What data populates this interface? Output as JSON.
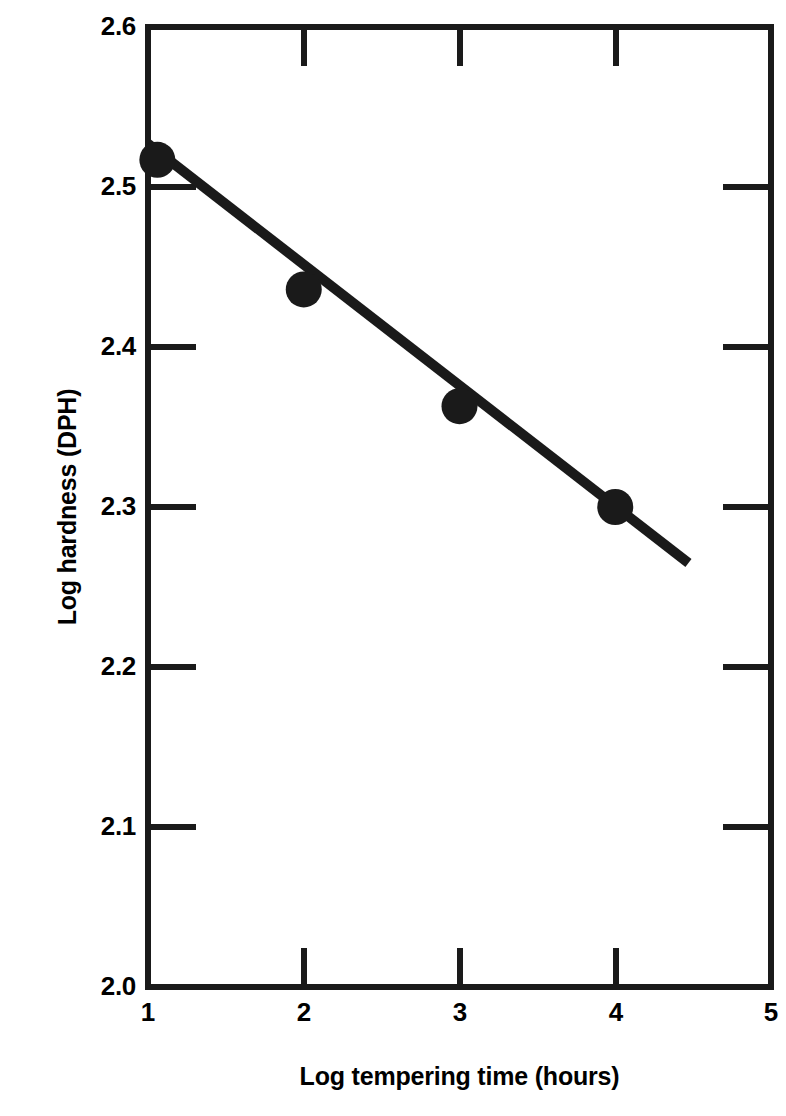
{
  "chart_data": {
    "type": "scatter",
    "title": "",
    "xlabel": "Log tempering time (hours)",
    "ylabel": "Log hardness (DPH)",
    "xlim": [
      1,
      5
    ],
    "ylim": [
      2.0,
      2.6
    ],
    "xticks": [
      1,
      2,
      3,
      4,
      5
    ],
    "xtick_labels": [
      "1",
      "2",
      "3",
      "4",
      "5"
    ],
    "yticks": [
      2.0,
      2.1,
      2.2,
      2.3,
      2.4,
      2.5,
      2.6
    ],
    "ytick_labels": [
      "2.0",
      "2.1",
      "2.2",
      "2.3",
      "2.4",
      "2.5",
      "2.6"
    ],
    "grid": false,
    "legend": false,
    "marker": "filled-circle",
    "marker_color": "#1a1a1a",
    "line_color": "#1a1a1a",
    "series": [
      {
        "name": "Log hardness vs log tempering time",
        "x": [
          1.06,
          2.0,
          3.0,
          4.0
        ],
        "y": [
          2.517,
          2.436,
          2.363,
          2.3
        ]
      }
    ],
    "fit_line": {
      "name": "linear fit",
      "x": [
        1.0,
        4.47
      ],
      "y": [
        2.527,
        2.265
      ],
      "slope": -0.0755,
      "intercept": 2.6025
    }
  },
  "axis": {
    "x_label": "Log tempering time (hours)",
    "y_label": "Log hardness (DPH)",
    "x_tick_labels": [
      "1",
      "2",
      "3",
      "4",
      "5"
    ],
    "y_tick_labels": [
      "2.0",
      "2.1",
      "2.2",
      "2.3",
      "2.4",
      "2.5",
      "2.6"
    ]
  },
  "colors": {
    "foreground": "#1a1a1a",
    "background": "#ffffff"
  }
}
